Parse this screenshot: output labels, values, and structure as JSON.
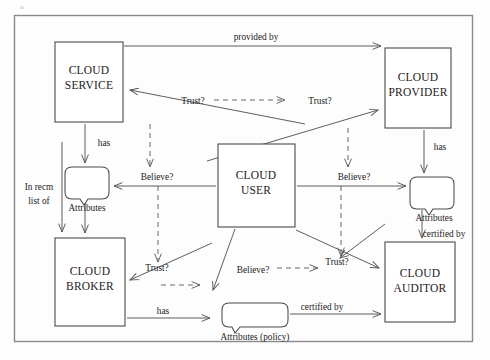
{
  "figure": {
    "type": "diagram",
    "corner_mark": "o",
    "frame": {
      "x": 14,
      "y": 15,
      "width": 459,
      "height": 327
    }
  },
  "nodes": [
    {
      "id": "cloud-service",
      "line1": "CLOUD",
      "line2": "SERVICE",
      "x": 55,
      "y": 42,
      "width": 68,
      "height": 80
    },
    {
      "id": "cloud-provider",
      "line1": "CLOUD",
      "line2": "PROVIDER",
      "x": 385,
      "y": 48,
      "width": 66,
      "height": 80
    },
    {
      "id": "cloud-user",
      "line1": "CLOUD",
      "line2": "USER",
      "x": 218,
      "y": 144,
      "width": 77,
      "height": 83
    },
    {
      "id": "cloud-broker",
      "line1": "CLOUD",
      "line2": "BROKER",
      "x": 55,
      "y": 238,
      "width": 70,
      "height": 88
    },
    {
      "id": "cloud-auditor",
      "line1": "CLOUD",
      "line2": "AUDITOR",
      "x": 385,
      "y": 242,
      "width": 70,
      "height": 80
    }
  ],
  "bubbles": [
    {
      "id": "attributes-service",
      "label": "Attributes",
      "x": 65,
      "y": 167,
      "width": 44,
      "height": 32
    },
    {
      "id": "attributes-provider",
      "label": "Attributes",
      "x": 410,
      "y": 177,
      "width": 44,
      "height": 32
    },
    {
      "id": "attributes-policy",
      "label": "Attributes (policy)",
      "x": 222,
      "y": 303,
      "width": 66,
      "height": 24
    }
  ],
  "edge_labels": [
    {
      "id": "provided-by",
      "text": "provided by",
      "x": 256,
      "y": 40
    },
    {
      "id": "trust-left-top",
      "text": "Trust?",
      "x": 193,
      "y": 102
    },
    {
      "id": "trust-right-top",
      "text": "Trust?",
      "x": 320,
      "y": 102
    },
    {
      "id": "has-service",
      "text": "has",
      "x": 104,
      "y": 143
    },
    {
      "id": "has-provider",
      "text": "has",
      "x": 438,
      "y": 146
    },
    {
      "id": "believe-left",
      "text": "Believe?",
      "x": 157,
      "y": 176
    },
    {
      "id": "believe-right",
      "text": "Believe?",
      "x": 354,
      "y": 176
    },
    {
      "id": "in-recm-list-1",
      "text": "In recm",
      "x": 39,
      "y": 186
    },
    {
      "id": "in-recm-list-2",
      "text": "list of",
      "x": 39,
      "y": 201
    },
    {
      "id": "certified-by-right",
      "text": "certified by",
      "x": 443,
      "y": 234
    },
    {
      "id": "trust-bottom-left",
      "text": "Trust?",
      "x": 157,
      "y": 268
    },
    {
      "id": "believe-bottom",
      "text": "Believe?",
      "x": 253,
      "y": 270
    },
    {
      "id": "trust-bottom-right",
      "text": "Trust?",
      "x": 337,
      "y": 262
    },
    {
      "id": "has-broker",
      "text": "has",
      "x": 163,
      "y": 311
    },
    {
      "id": "certified-by-bottom",
      "text": "certified by",
      "x": 320,
      "y": 307
    }
  ],
  "colors": {
    "box_stroke": "#4a4a4a",
    "frame_stroke": "#8a8a8a",
    "edge_stroke": "#555555",
    "text": "#1b1b1b",
    "background": "#fdfdfd"
  }
}
